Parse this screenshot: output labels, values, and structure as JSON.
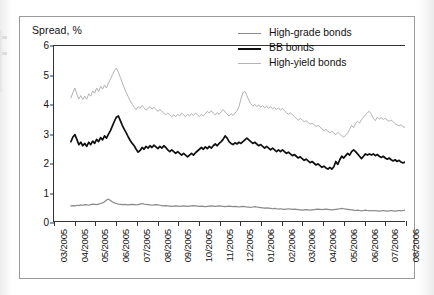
{
  "figure": {
    "axis_title": "Spread, %"
  },
  "legend": {
    "position": "top-right",
    "entries": [
      {
        "label": "High-grade bonds",
        "color": "#8a8a8a",
        "width": 1.9
      },
      {
        "label": "BB bonds",
        "color": "#101010",
        "width": 2.1
      },
      {
        "label": "High-yield bonds",
        "color": "#b2b2b2",
        "width": 1.3
      }
    ]
  },
  "chart_data": {
    "type": "line",
    "title": "",
    "subtitle": "",
    "xlabel": "",
    "ylabel": "Spread, %",
    "ylim": [
      0,
      6
    ],
    "yticks": [
      0,
      1,
      2,
      3,
      4,
      5,
      6
    ],
    "grid": false,
    "x_tick_labels": [
      "03/2005",
      "04/2005",
      "05/2005",
      "06/2005",
      "07/2005",
      "08/2005",
      "09/2005",
      "10/2005",
      "11/2005",
      "12/2005",
      "01/2006",
      "02/2006",
      "03/2006",
      "04/2006",
      "05/2006",
      "06/2006",
      "07/2006",
      "08/2006"
    ],
    "x_range": [
      "03/2005",
      "08/2006"
    ],
    "note": "Daily series; values are percentage-point spreads read off the axis.",
    "series": [
      {
        "name": "High-grade bonds",
        "color": "#8a8a8a",
        "values": [
          0.52,
          0.53,
          0.52,
          0.54,
          0.53,
          0.55,
          0.54,
          0.56,
          0.55,
          0.54,
          0.56,
          0.58,
          0.57,
          0.56,
          0.58,
          0.6,
          0.62,
          0.66,
          0.72,
          0.75,
          0.7,
          0.65,
          0.62,
          0.6,
          0.58,
          0.57,
          0.56,
          0.57,
          0.56,
          0.55,
          0.56,
          0.57,
          0.56,
          0.55,
          0.56,
          0.58,
          0.6,
          0.58,
          0.57,
          0.56,
          0.55,
          0.54,
          0.55,
          0.56,
          0.55,
          0.54,
          0.53,
          0.52,
          0.53,
          0.52,
          0.51,
          0.5,
          0.51,
          0.52,
          0.51,
          0.5,
          0.51,
          0.52,
          0.51,
          0.5,
          0.51,
          0.52,
          0.53,
          0.52,
          0.51,
          0.5,
          0.51,
          0.5,
          0.49,
          0.5,
          0.51,
          0.52,
          0.51,
          0.5,
          0.51,
          0.52,
          0.51,
          0.5,
          0.49,
          0.5,
          0.51,
          0.5,
          0.49,
          0.5,
          0.49,
          0.48,
          0.49,
          0.5,
          0.49,
          0.48,
          0.48,
          0.47,
          0.48,
          0.49,
          0.48,
          0.47,
          0.46,
          0.45,
          0.44,
          0.45,
          0.44,
          0.43,
          0.42,
          0.43,
          0.42,
          0.41,
          0.42,
          0.41,
          0.4,
          0.41,
          0.42,
          0.41,
          0.4,
          0.41,
          0.4,
          0.39,
          0.38,
          0.37,
          0.38,
          0.39,
          0.38,
          0.37,
          0.38,
          0.39,
          0.4,
          0.41,
          0.4,
          0.39,
          0.4,
          0.41,
          0.4,
          0.39,
          0.38,
          0.39,
          0.4,
          0.41,
          0.42,
          0.43,
          0.42,
          0.41,
          0.4,
          0.39,
          0.38,
          0.37,
          0.36,
          0.37,
          0.36,
          0.35,
          0.36,
          0.37,
          0.36,
          0.35,
          0.36,
          0.35,
          0.36,
          0.35,
          0.34,
          0.35,
          0.36,
          0.35,
          0.34,
          0.35,
          0.36,
          0.35,
          0.34,
          0.35,
          0.36,
          0.35,
          0.36,
          0.37
        ]
      },
      {
        "name": "BB bonds",
        "color": "#101010",
        "values": [
          2.72,
          2.88,
          2.96,
          2.8,
          2.62,
          2.7,
          2.58,
          2.66,
          2.56,
          2.7,
          2.62,
          2.74,
          2.66,
          2.8,
          2.72,
          2.86,
          2.78,
          2.92,
          2.84,
          2.98,
          3.1,
          3.26,
          3.42,
          3.56,
          3.6,
          3.44,
          3.28,
          3.14,
          3.02,
          2.88,
          2.76,
          2.66,
          2.58,
          2.46,
          2.36,
          2.42,
          2.52,
          2.46,
          2.56,
          2.5,
          2.58,
          2.52,
          2.6,
          2.54,
          2.48,
          2.56,
          2.5,
          2.58,
          2.52,
          2.44,
          2.38,
          2.44,
          2.38,
          2.32,
          2.38,
          2.32,
          2.26,
          2.32,
          2.26,
          2.2,
          2.26,
          2.32,
          2.26,
          2.34,
          2.4,
          2.46,
          2.52,
          2.46,
          2.54,
          2.48,
          2.56,
          2.5,
          2.58,
          2.64,
          2.58,
          2.66,
          2.72,
          2.8,
          2.92,
          2.84,
          2.72,
          2.66,
          2.62,
          2.68,
          2.64,
          2.7,
          2.66,
          2.72,
          2.78,
          2.84,
          2.78,
          2.72,
          2.66,
          2.7,
          2.64,
          2.58,
          2.62,
          2.56,
          2.5,
          2.56,
          2.5,
          2.44,
          2.5,
          2.44,
          2.38,
          2.44,
          2.38,
          2.44,
          2.38,
          2.32,
          2.36,
          2.3,
          2.24,
          2.28,
          2.22,
          2.16,
          2.2,
          2.14,
          2.08,
          2.12,
          2.06,
          2.0,
          2.04,
          1.98,
          1.92,
          1.96,
          1.9,
          1.84,
          1.88,
          1.82,
          1.78,
          1.84,
          1.78,
          1.86,
          2.04,
          1.94,
          2.1,
          2.22,
          2.16,
          2.24,
          2.32,
          2.26,
          2.38,
          2.44,
          2.38,
          2.3,
          2.22,
          2.14,
          2.22,
          2.3,
          2.26,
          2.3,
          2.26,
          2.3,
          2.24,
          2.28,
          2.22,
          2.18,
          2.22,
          2.16,
          2.12,
          2.16,
          2.1,
          2.06,
          2.1,
          2.04,
          2.08,
          2.02,
          1.99,
          2.02
        ]
      },
      {
        "name": "High-yield bonds",
        "color": "#b2b2b2",
        "values": [
          4.22,
          4.4,
          4.56,
          4.34,
          4.18,
          4.3,
          4.16,
          4.28,
          4.18,
          4.36,
          4.28,
          4.46,
          4.38,
          4.56,
          4.44,
          4.62,
          4.52,
          4.66,
          4.56,
          4.74,
          4.86,
          5.02,
          5.16,
          5.24,
          5.1,
          4.92,
          4.74,
          4.56,
          4.4,
          4.26,
          4.12,
          4.0,
          3.9,
          3.82,
          3.92,
          3.86,
          3.96,
          3.88,
          3.8,
          3.86,
          3.92,
          3.84,
          3.9,
          3.82,
          3.76,
          3.82,
          3.76,
          3.7,
          3.64,
          3.7,
          3.64,
          3.58,
          3.64,
          3.58,
          3.66,
          3.6,
          3.7,
          3.64,
          3.58,
          3.66,
          3.6,
          3.68,
          3.62,
          3.7,
          3.64,
          3.58,
          3.66,
          3.6,
          3.68,
          3.76,
          3.7,
          3.78,
          3.7,
          3.64,
          3.72,
          3.66,
          3.74,
          3.82,
          3.74,
          3.66,
          3.6,
          3.68,
          3.62,
          3.7,
          3.78,
          3.92,
          4.18,
          4.4,
          4.44,
          4.3,
          4.14,
          4.02,
          3.94,
          4.0,
          3.92,
          3.98,
          3.9,
          3.96,
          3.88,
          3.94,
          3.86,
          3.92,
          3.84,
          3.9,
          3.82,
          3.88,
          3.8,
          3.86,
          3.78,
          3.72,
          3.66,
          3.72,
          3.64,
          3.58,
          3.52,
          3.46,
          3.52,
          3.46,
          3.4,
          3.44,
          3.38,
          3.32,
          3.36,
          3.3,
          3.24,
          3.28,
          3.22,
          3.16,
          3.1,
          3.14,
          3.08,
          3.02,
          3.08,
          3.02,
          2.96,
          3.04,
          2.98,
          2.92,
          2.88,
          2.94,
          3.02,
          3.14,
          3.28,
          3.2,
          3.34,
          3.42,
          3.36,
          3.48,
          3.56,
          3.64,
          3.72,
          3.76,
          3.66,
          3.52,
          3.44,
          3.56,
          3.5,
          3.54,
          3.48,
          3.52,
          3.46,
          3.42,
          3.46,
          3.4,
          3.34,
          3.3,
          3.26,
          3.3,
          3.24,
          3.2
        ]
      }
    ]
  }
}
